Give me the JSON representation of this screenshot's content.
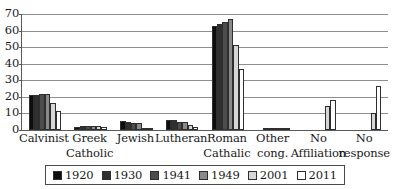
{
  "chart_data": {
    "type": "bar",
    "title": "",
    "xlabel": "",
    "ylabel": "",
    "ylim": [
      0,
      70
    ],
    "ytick_step": 10,
    "yticks": [
      70,
      60,
      50,
      40,
      30,
      20,
      10,
      0
    ],
    "grid": true,
    "legend_position": "bottom",
    "categories": [
      "Calvinist",
      "Greek Catholic",
      "Jewish",
      "Lutheran",
      "Roman Cathalic",
      "Other cong.",
      "No Affiliation",
      "No response"
    ],
    "category_lines": [
      [
        "Calvinist",
        ""
      ],
      [
        "Greek",
        "Catholic"
      ],
      [
        "Jewish",
        ""
      ],
      [
        "Lutheran",
        ""
      ],
      [
        "Roman",
        "Cathalic"
      ],
      [
        "Other",
        "cong."
      ],
      [
        "No",
        "Affiliation"
      ],
      [
        "No",
        "response"
      ]
    ],
    "series": [
      {
        "name": "1920",
        "color": "#0d0d0d",
        "values": [
          21.0,
          2.0,
          5.5,
          6.0,
          63.0,
          0.0,
          0.0,
          0.0
        ]
      },
      {
        "name": "1930",
        "color": "#303030",
        "values": [
          21.0,
          2.2,
          4.6,
          6.0,
          64.0,
          0.4,
          0.0,
          0.0
        ]
      },
      {
        "name": "1941",
        "color": "#4d4d4d",
        "values": [
          22.0,
          2.2,
          4.2,
          5.0,
          65.0,
          0.5,
          0.0,
          0.0
        ]
      },
      {
        "name": "1949",
        "color": "#8a8a8a",
        "values": [
          21.5,
          2.2,
          4.0,
          4.7,
          67.0,
          0.4,
          0.0,
          0.0
        ]
      },
      {
        "name": "2001",
        "color": "#d6d6d6",
        "values": [
          16.3,
          2.4,
          1.2,
          3.0,
          51.3,
          0.3,
          14.2,
          10.4
        ]
      },
      {
        "name": "2011",
        "color": "#ffffff",
        "values": [
          11.6,
          1.8,
          0.3,
          2.1,
          37.1,
          1.0,
          18.0,
          26.5
        ]
      }
    ]
  },
  "legend": {
    "items": [
      {
        "label": "1920",
        "color": "#0d0d0d"
      },
      {
        "label": "1930",
        "color": "#303030"
      },
      {
        "label": "1941",
        "color": "#4d4d4d"
      },
      {
        "label": "1949",
        "color": "#8a8a8a"
      },
      {
        "label": "2001",
        "color": "#d6d6d6"
      },
      {
        "label": "2011",
        "color": "#ffffff"
      }
    ]
  }
}
